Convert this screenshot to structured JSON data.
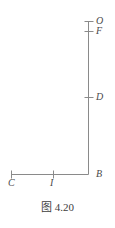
{
  "figure": {
    "caption": "图 4.20",
    "background_color": "#ffffff",
    "line_color": "#8a8a8a",
    "label_color": "#4a4a4a",
    "stroke_width": 1,
    "type": "geometry-line-diagram",
    "geometry": {
      "vertical_line": {
        "x": 88,
        "y_top": 21,
        "y_bottom": 174
      },
      "horizontal_line": {
        "y": 174,
        "x_left": 11,
        "x_right": 88
      },
      "corner_point": "B"
    },
    "points": [
      {
        "id": "O",
        "label": "O",
        "axis": "vertical",
        "x": 88,
        "y": 21,
        "tick": true,
        "label_x": 96,
        "label_y": 16
      },
      {
        "id": "F",
        "label": "F",
        "axis": "vertical",
        "x": 88,
        "y": 31,
        "tick": true,
        "label_x": 96,
        "label_y": 26
      },
      {
        "id": "D",
        "label": "D",
        "axis": "vertical",
        "x": 88,
        "y": 97,
        "tick": true,
        "label_x": 96,
        "label_y": 92
      },
      {
        "id": "B",
        "label": "B",
        "axis": "corner",
        "x": 88,
        "y": 174,
        "tick": false,
        "label_x": 96,
        "label_y": 169
      },
      {
        "id": "C",
        "label": "C",
        "axis": "horizontal",
        "x": 11,
        "y": 174,
        "tick": true,
        "label_x": 8,
        "label_y": 178
      },
      {
        "id": "I",
        "label": "I",
        "axis": "horizontal",
        "x": 53,
        "y": 174,
        "tick": true,
        "label_x": 50,
        "label_y": 178
      }
    ],
    "tick_half_length": 4
  }
}
